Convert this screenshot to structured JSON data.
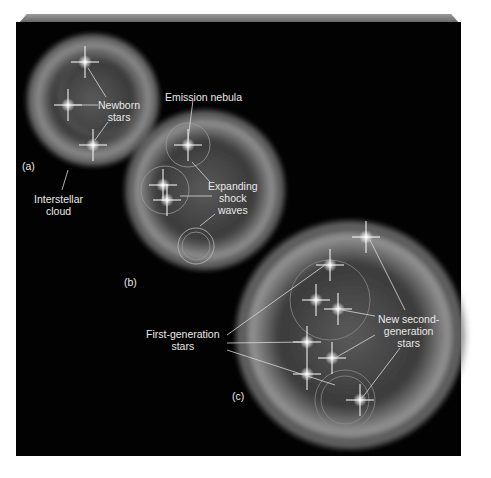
{
  "diagram": {
    "panels": [
      {
        "id": "a",
        "label": "(a)"
      },
      {
        "id": "b",
        "label": "(b)"
      },
      {
        "id": "c",
        "label": "(c)"
      }
    ],
    "labels": {
      "newborn_stars_1": "Newborn",
      "newborn_stars_2": "stars",
      "interstellar_cloud_1": "Interstellar",
      "interstellar_cloud_2": "cloud",
      "emission_nebula": "Emission nebula",
      "expanding_1": "Expanding",
      "expanding_2": "shock",
      "expanding_3": "waves",
      "first_gen_1": "First-generation",
      "first_gen_2": "stars",
      "new_second_1": "New second-",
      "new_second_2": "generation",
      "new_second_3": "stars"
    },
    "colors": {
      "background": "#020202",
      "cloud": "#bfbfbf",
      "text": "#e8e8e8"
    }
  }
}
